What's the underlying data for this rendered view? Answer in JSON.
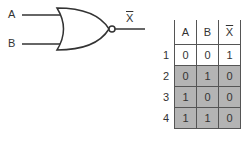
{
  "gate": {
    "type": "NOR",
    "input_a_label": "A",
    "input_b_label": "B",
    "output_label": "X"
  },
  "truth_table": {
    "headers": [
      "A",
      "B",
      "X"
    ],
    "output_overline": true,
    "rows": [
      {
        "index": "1",
        "a": "0",
        "b": "0",
        "x": "1",
        "shaded": false
      },
      {
        "index": "2",
        "a": "0",
        "b": "1",
        "x": "0",
        "shaded": true
      },
      {
        "index": "3",
        "a": "1",
        "b": "0",
        "x": "0",
        "shaded": true
      },
      {
        "index": "4",
        "a": "1",
        "b": "1",
        "x": "0",
        "shaded": true
      }
    ]
  },
  "colors": {
    "line": "#333333",
    "shade": "#b4b4b4"
  }
}
